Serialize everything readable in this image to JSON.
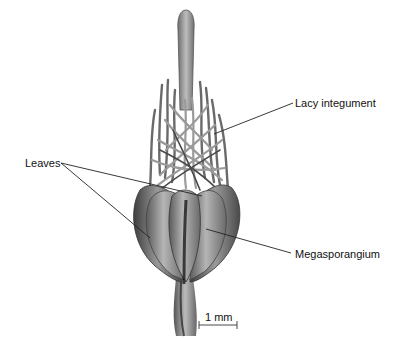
{
  "diagram": {
    "labels": {
      "lacy_integument": "Lacy integument",
      "leaves": "Leaves",
      "megasporangium": "Megasporangium"
    },
    "scale_bar": {
      "label": "1 mm"
    },
    "colors": {
      "background": "#ffffff",
      "leader_line": "#222222",
      "structure_dark": "#3a3a3a",
      "structure_mid": "#8a8a8a",
      "structure_light": "#c4c4c4"
    }
  }
}
